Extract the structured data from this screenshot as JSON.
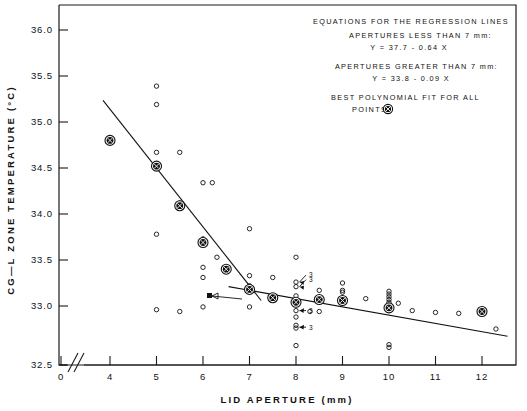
{
  "chart_data": {
    "type": "scatter",
    "title": "",
    "xlabel": "LID  APERTURE    (mm)",
    "ylabel": "CG—L  ZONE  TEMPERATURE    (°C)",
    "xlim": [
      3.55,
      12.7
    ],
    "ylim": [
      32.5,
      36.15
    ],
    "xticks": [
      0,
      4,
      5,
      6,
      7,
      8,
      9,
      10,
      11,
      12
    ],
    "xticklabels": [
      "0",
      "4",
      "5",
      "6",
      "7",
      "8",
      "9",
      "10",
      "11",
      "12"
    ],
    "yticks": [
      32.5,
      33.0,
      33.5,
      34.0,
      34.5,
      35.0,
      35.5,
      36.0
    ],
    "yticklabels": [
      "32.5",
      "33.0",
      "33.5",
      "34.0",
      "34.5",
      "35.0",
      "35.5",
      "36.0"
    ],
    "grid": false,
    "axis_break": true,
    "axis_break_note": "broken x-axis between 0 and 4",
    "legend_position": "none",
    "series": [
      {
        "name": "individual measurements",
        "marker": "open-circle",
        "points": [
          [
            4.0,
            34.8
          ],
          [
            5.0,
            35.39
          ],
          [
            5.0,
            35.19
          ],
          [
            5.0,
            34.67
          ],
          [
            5.0,
            34.52
          ],
          [
            5.0,
            33.78
          ],
          [
            5.0,
            32.96
          ],
          [
            5.5,
            34.67
          ],
          [
            5.5,
            34.12
          ],
          [
            5.5,
            34.09
          ],
          [
            5.5,
            32.94
          ],
          [
            6.0,
            34.34
          ],
          [
            6.0,
            33.73
          ],
          [
            6.0,
            33.68
          ],
          [
            6.0,
            33.42
          ],
          [
            6.0,
            33.31
          ],
          [
            6.0,
            32.99
          ],
          [
            6.2,
            34.34
          ],
          [
            6.3,
            33.53
          ],
          [
            6.5,
            33.4
          ],
          [
            7.0,
            33.84
          ],
          [
            7.0,
            33.33
          ],
          [
            7.0,
            33.22
          ],
          [
            7.0,
            33.19
          ],
          [
            7.0,
            32.99
          ],
          [
            7.5,
            33.31
          ],
          [
            7.5,
            33.09
          ],
          [
            8.0,
            33.53
          ],
          [
            8.0,
            33.26
          ],
          [
            8.0,
            33.21
          ],
          [
            8.0,
            33.11
          ],
          [
            8.0,
            33.04
          ],
          [
            8.0,
            32.95
          ],
          [
            8.0,
            32.88
          ],
          [
            8.0,
            32.79
          ],
          [
            8.0,
            32.76
          ],
          [
            8.0,
            32.57
          ],
          [
            8.3,
            32.94
          ],
          [
            8.5,
            33.17
          ],
          [
            8.5,
            33.07
          ],
          [
            8.5,
            32.94
          ],
          [
            9.0,
            33.25
          ],
          [
            9.0,
            33.17
          ],
          [
            9.0,
            33.15
          ],
          [
            9.0,
            33.06
          ],
          [
            9.5,
            33.08
          ],
          [
            10.0,
            33.16
          ],
          [
            10.0,
            33.13
          ],
          [
            10.0,
            33.1
          ],
          [
            10.0,
            33.07
          ],
          [
            10.0,
            33.04
          ],
          [
            10.0,
            32.98
          ],
          [
            10.0,
            32.58
          ],
          [
            10.0,
            32.55
          ],
          [
            10.2,
            33.03
          ],
          [
            10.5,
            32.95
          ],
          [
            11.0,
            32.93
          ],
          [
            11.5,
            32.92
          ],
          [
            12.0,
            32.94
          ],
          [
            12.3,
            32.75
          ]
        ]
      },
      {
        "name": "best polynomial fit for all points",
        "marker": "circled-x",
        "points": [
          [
            4.0,
            34.8
          ],
          [
            5.0,
            34.52
          ],
          [
            5.5,
            34.09
          ],
          [
            6.0,
            33.69
          ],
          [
            6.5,
            33.4
          ],
          [
            7.0,
            33.18
          ],
          [
            7.5,
            33.09
          ],
          [
            8.0,
            33.04
          ],
          [
            8.5,
            33.07
          ],
          [
            9.0,
            33.06
          ],
          [
            10.0,
            32.98
          ],
          [
            12.0,
            32.94
          ]
        ]
      }
    ],
    "multiplicity_labels": [
      {
        "x": 8.0,
        "y": 33.26,
        "text": "3"
      },
      {
        "x": 8.0,
        "y": 33.21,
        "text": "3"
      },
      {
        "x": 8.0,
        "y": 32.95,
        "text": "3"
      },
      {
        "x": 8.0,
        "y": 32.77,
        "text": "3"
      }
    ],
    "regression_lines": [
      {
        "name": "apertures less than 7 mm",
        "equation": "Y = 37.7 - 0.64 X",
        "intercept": 37.7,
        "slope": -0.64,
        "x_from": 3.85,
        "x_to": 7.25
      },
      {
        "name": "apertures greater than 7 mm",
        "equation": "Y = 33.8 - 0.09 X",
        "intercept": 33.8,
        "slope": -0.09,
        "x_from": 6.55,
        "x_to": 12.55
      }
    ]
  },
  "legend_box": {
    "lines": [
      "EQUATIONS FOR THE REGRESSION LINES",
      "APERTURES LESS THAN 7 mm:",
      "Y = 37.7 - 0.64 X",
      "APERTURES GREATER THAN  7 mm:",
      "Y = 33.8 - 0.09 X",
      "BEST POLYNOMIAL FIT FOR ALL",
      "POINTS"
    ],
    "marker_name": "circled-x-marker"
  }
}
